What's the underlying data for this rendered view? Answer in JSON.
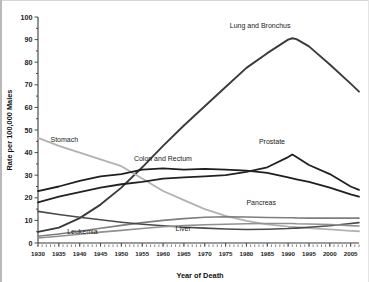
{
  "chart_data": {
    "type": "line",
    "title": "",
    "xlabel": "Year of Death",
    "ylabel": "Rate per 100,000 Males",
    "xlim": [
      1930,
      2007
    ],
    "ylim": [
      0,
      100
    ],
    "ytick_step": 10,
    "xtick_step": 5,
    "grid": false,
    "legend_position": "inline-labels",
    "ytick_labels": [
      "0",
      "10",
      "20",
      "30",
      "40",
      "50",
      "60",
      "70",
      "80",
      "90",
      "100"
    ],
    "xtick_labels": [
      "1930",
      "1935",
      "1940",
      "1945",
      "1950",
      "1955",
      "1960",
      "1965",
      "1970",
      "1975",
      "1980",
      "1985",
      "1990",
      "1995",
      "2000",
      "2005"
    ],
    "x": [
      1930,
      1935,
      1940,
      1945,
      1950,
      1955,
      1960,
      1965,
      1970,
      1975,
      1980,
      1985,
      1990,
      1991,
      1992,
      1995,
      2000,
      2005,
      2007
    ],
    "series": [
      {
        "name": "Lung and Bronchus",
        "color": "#3a3a3a",
        "width": 1.9,
        "label_x": 1976,
        "label_y": 95,
        "values": [
          4.9,
          6.8,
          11.0,
          17.0,
          24.5,
          33.5,
          43.0,
          52.0,
          60.5,
          69.0,
          77.5,
          84.0,
          90.0,
          90.6,
          90.2,
          87.0,
          79.0,
          70.5,
          67.0
        ]
      },
      {
        "name": "Stomach",
        "color": "#b2b2b2",
        "width": 1.8,
        "label_x": 1933,
        "label_y": 44.5,
        "values": [
          46.5,
          43.0,
          40.0,
          37.0,
          34.0,
          28.5,
          23.0,
          19.0,
          15.0,
          12.0,
          9.8,
          8.2,
          7.2,
          7.1,
          7.0,
          6.6,
          6.0,
          5.4,
          5.2
        ]
      },
      {
        "name": "Colon and Rectum",
        "color": "#1f1f1f",
        "width": 1.8,
        "label_x": 1953,
        "label_y": 36.5,
        "values": [
          23.0,
          25.0,
          27.5,
          29.5,
          30.5,
          32.5,
          33.0,
          32.5,
          32.8,
          32.5,
          32.0,
          31.0,
          29.0,
          28.6,
          28.2,
          27.0,
          24.5,
          21.5,
          20.5
        ]
      },
      {
        "name": "Prostate",
        "color": "#222222",
        "width": 1.8,
        "label_x": 1983,
        "label_y": 44,
        "values": [
          18.0,
          20.5,
          22.5,
          24.5,
          26.0,
          27.0,
          28.5,
          29.0,
          29.5,
          30.0,
          31.5,
          33.5,
          38.0,
          39.2,
          38.0,
          34.5,
          30.5,
          25.0,
          23.5
        ]
      },
      {
        "name": "Pancreas",
        "color": "#7e7e7e",
        "width": 1.6,
        "label_x": 1980,
        "label_y": 17,
        "values": [
          3.0,
          4.0,
          5.2,
          6.5,
          7.8,
          9.0,
          10.0,
          10.8,
          11.4,
          11.6,
          11.5,
          11.3,
          11.2,
          11.2,
          11.1,
          11.0,
          11.0,
          11.0,
          11.0
        ]
      },
      {
        "name": "Liver",
        "color": "#4a4a4a",
        "width": 1.6,
        "label_x": 1963,
        "label_y": 5.5,
        "values": [
          14.0,
          12.6,
          11.4,
          10.3,
          9.2,
          8.3,
          7.6,
          7.0,
          6.6,
          6.2,
          6.0,
          6.1,
          6.4,
          6.5,
          6.6,
          7.0,
          7.6,
          8.6,
          9.0
        ]
      },
      {
        "name": "Leukemia",
        "color": "#909090",
        "width": 1.6,
        "label_x": 1937,
        "label_y": 4.2,
        "values": [
          2.2,
          3.0,
          3.9,
          4.8,
          5.6,
          6.4,
          7.2,
          7.7,
          8.1,
          8.3,
          8.5,
          8.6,
          8.6,
          8.6,
          8.5,
          8.4,
          8.2,
          7.7,
          7.5
        ]
      }
    ]
  }
}
